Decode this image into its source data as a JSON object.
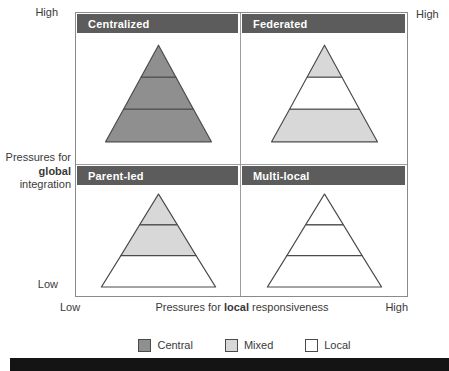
{
  "colors": {
    "header_band": "#5c5c5c",
    "central": "#8f8f8f",
    "mixed": "#d8d8d8",
    "local": "#ffffff",
    "pyramid_stroke": "#4a4a4a",
    "matrix_border": "#8a8a8a",
    "text": "#3a3a3a",
    "band_text": "#ffffff",
    "bottom_bar": "#141414"
  },
  "axes": {
    "y_high": "High",
    "y_low": "Low",
    "y_title": [
      "Pressures for",
      "global",
      "integration"
    ],
    "x_low": "Low",
    "x_high": "High",
    "x_title_pre": "Pressures for ",
    "x_title_bold": "local",
    "x_title_post": " responsiveness",
    "top_right_high": "High"
  },
  "quadrants": [
    {
      "title": "Centralized",
      "sections": [
        "central",
        "central",
        "central"
      ]
    },
    {
      "title": "Federated",
      "sections": [
        "mixed",
        "local",
        "mixed"
      ]
    },
    {
      "title": "Parent-led",
      "sections": [
        "mixed",
        "mixed",
        "local"
      ]
    },
    {
      "title": "Multi-local",
      "sections": [
        "local",
        "local",
        "local"
      ]
    }
  ],
  "legend": [
    {
      "label": "Central",
      "color_key": "central"
    },
    {
      "label": "Mixed",
      "color_key": "mixed"
    },
    {
      "label": "Local",
      "color_key": "local"
    }
  ]
}
